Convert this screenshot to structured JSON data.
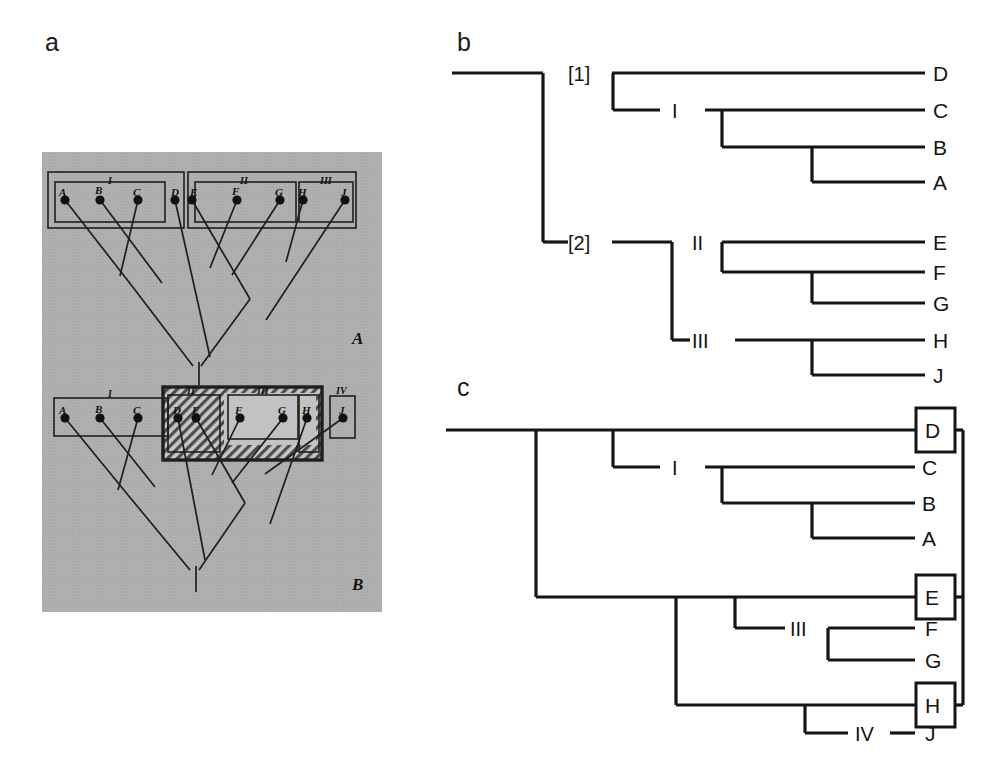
{
  "figure": {
    "panels": [
      {
        "id": "a",
        "letter": "a",
        "caption_letter": "a"
      },
      {
        "id": "b",
        "letter": "b",
        "caption_letter": "b"
      },
      {
        "id": "c",
        "letter": "c",
        "caption_letter": "c"
      }
    ]
  },
  "panel_a": {
    "letter": "a",
    "style": "halftone photographic reproduction, gray paper background",
    "diagrams": [
      {
        "id": "A",
        "label": "A",
        "terminals": [
          "A",
          "B",
          "C",
          "D",
          "E",
          "F",
          "G",
          "H",
          "J"
        ],
        "terminal_count": 9,
        "group_labels": [
          "I",
          "II",
          "III"
        ],
        "groups": [
          {
            "label": "I",
            "members": [
              "A",
              "B",
              "C"
            ]
          },
          {
            "label": "II",
            "members": [
              "E",
              "F",
              "G"
            ]
          },
          {
            "label": "III",
            "members": [
              "H",
              "J"
            ]
          }
        ],
        "outer_boxes": [
          {
            "members": [
              "A",
              "B",
              "C",
              "D"
            ]
          },
          {
            "members": [
              "E",
              "F",
              "G",
              "H",
              "J"
            ]
          }
        ]
      },
      {
        "id": "B",
        "label": "B",
        "terminals": [
          "A",
          "B",
          "C",
          "D",
          "E",
          "F",
          "G",
          "H",
          "J"
        ],
        "terminal_count": 9,
        "group_labels": [
          "I",
          "II",
          "III",
          "IV"
        ],
        "groups": [
          {
            "label": "I",
            "members": [
              "A",
              "B",
              "C"
            ]
          },
          {
            "label": "II",
            "members": [
              "D",
              "E"
            ],
            "shading": "hatched"
          },
          {
            "label": "III",
            "members": [
              "F",
              "G"
            ]
          },
          {
            "label": "IV",
            "members": [
              "J"
            ]
          }
        ],
        "emphasis_box": {
          "style": "bold outline, hatched fill",
          "encloses": [
            "II",
            "III",
            "H"
          ]
        }
      }
    ],
    "terminal_labels_top": [
      "A",
      "B",
      "C",
      "D",
      "E",
      "F",
      "G",
      "H",
      "J"
    ],
    "terminal_labels_bottom": [
      "A",
      "B",
      "C",
      "D",
      "E",
      "F",
      "G",
      "H",
      "J"
    ]
  },
  "panel_b": {
    "letter": "b",
    "type": "cladogram",
    "root_nodes": [
      "[1]",
      "[2]"
    ],
    "node_labels": [
      "[1]",
      "[2]",
      "I",
      "II",
      "III"
    ],
    "taxa": [
      "D",
      "C",
      "B",
      "A",
      "E",
      "F",
      "G",
      "H",
      "J"
    ],
    "clades": [
      {
        "label": "[1]",
        "taxa": [
          "D",
          "C",
          "B",
          "A"
        ]
      },
      {
        "label": "I",
        "taxa": [
          "C",
          "B",
          "A"
        ]
      },
      {
        "label": "[2]",
        "taxa": [
          "E",
          "F",
          "G",
          "H",
          "J"
        ]
      },
      {
        "label": "II",
        "taxa": [
          "E",
          "F",
          "G"
        ]
      },
      {
        "label": "III",
        "taxa": [
          "H",
          "J"
        ]
      }
    ],
    "tip_order": [
      "D",
      "C",
      "B",
      "A",
      "E",
      "F",
      "G",
      "H",
      "J"
    ]
  },
  "panel_c": {
    "letter": "c",
    "type": "cladogram",
    "node_labels": [
      "I",
      "III",
      "IV"
    ],
    "taxa": [
      "D",
      "C",
      "B",
      "A",
      "E",
      "F",
      "G",
      "H",
      "J"
    ],
    "boxed_taxa": [
      "D",
      "E",
      "H"
    ],
    "clades": [
      {
        "label": "I",
        "taxa": [
          "C",
          "B",
          "A"
        ]
      },
      {
        "label": "III",
        "taxa": [
          "F",
          "G"
        ]
      },
      {
        "label": "IV",
        "taxa": [
          "J"
        ]
      }
    ],
    "tip_order": [
      "D",
      "C",
      "B",
      "A",
      "E",
      "F",
      "G",
      "H",
      "J"
    ],
    "connector": {
      "style": "vertical bracket on right",
      "links": [
        "D",
        "E",
        "H"
      ]
    }
  },
  "colors": {
    "ink": "#111111",
    "line": "#1a1a1a",
    "photo_bg": "#b9b9b9",
    "photo_bg_light": "#c2c2c2",
    "hatch": "#5a5a5a",
    "white": "#ffffff"
  }
}
